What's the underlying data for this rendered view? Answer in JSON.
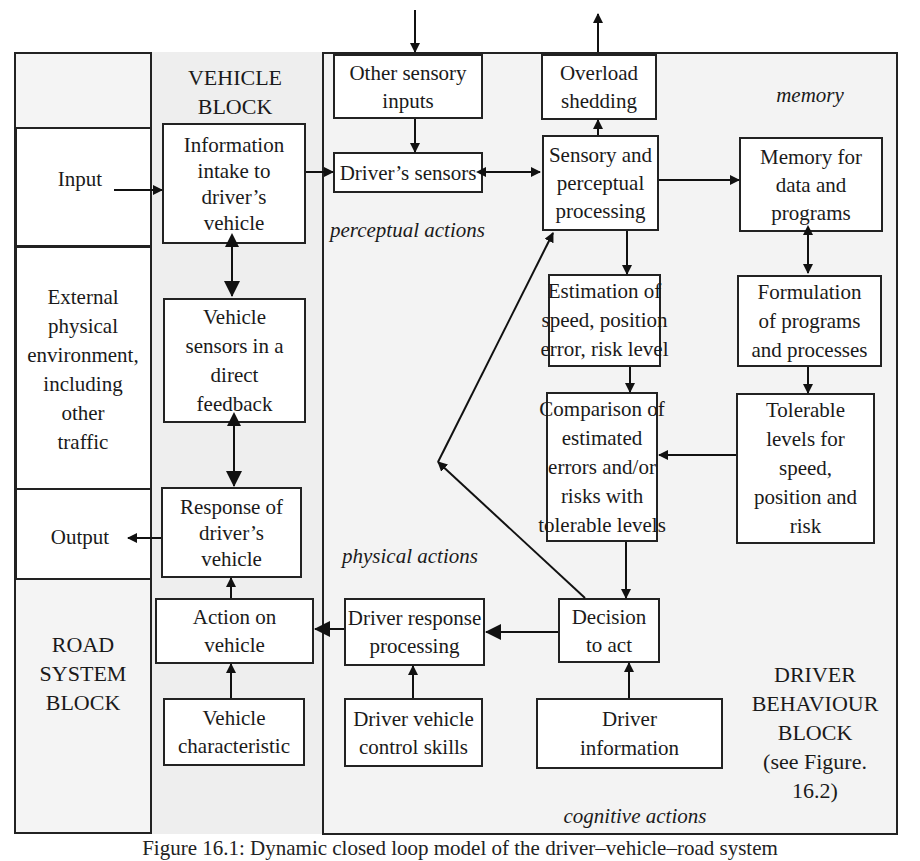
{
  "colors": {
    "background": "#ffffff",
    "panel_gray": "#eeeeee",
    "line": "#222222"
  },
  "road_block": {
    "title": "ROAD\nSYSTEM\nBLOCK",
    "input_label": "Input",
    "environment_label": "External\nphysical\nenvironment,\nincluding\nother\ntraffic",
    "output_label": "Output"
  },
  "vehicle_block": {
    "title": "VEHICLE\nBLOCK",
    "boxes": {
      "info_intake": "Information\nintake to\ndriver’s\nvehicle",
      "vehicle_sensors": "Vehicle\nsensors in a\ndirect\nfeedback",
      "response": "Response of\ndriver’s\nvehicle",
      "action": "Action on\nvehicle",
      "characteristic": "Vehicle\ncharacteristic"
    }
  },
  "driver_block": {
    "title": "DRIVER\nBEHAVIOUR\nBLOCK\n(see Figure.\n16.2)",
    "section_labels": {
      "memory": "memory",
      "perceptual": "perceptual actions",
      "physical": "physical actions",
      "cognitive": "cognitive actions"
    },
    "boxes": {
      "other_sensory": "Other sensory\ninputs",
      "drivers_sensors": "Driver’s sensors",
      "overload": "Overload\nshedding",
      "sensory_perceptual": "Sensory and\nperceptual\nprocessing",
      "memory": "Memory for\ndata and\nprograms",
      "estimation": "Estimation of\nspeed, position\nerror, risk level",
      "formulation": "Formulation\nof programs\nand processes",
      "comparison": "Comparison of\nestimated\nerrors and/or\nrisks with\ntolerable levels",
      "tolerable": "Tolerable\nlevels for\nspeed,\nposition and\nrisk",
      "decision": "Decision\nto act",
      "response_processing": "Driver response\nprocessing",
      "control_skills": "Driver vehicle\ncontrol skills",
      "driver_information": "Driver\ninformation"
    }
  },
  "caption": "Figure 16.1: Dynamic closed loop model of the driver–vehicle–road system"
}
